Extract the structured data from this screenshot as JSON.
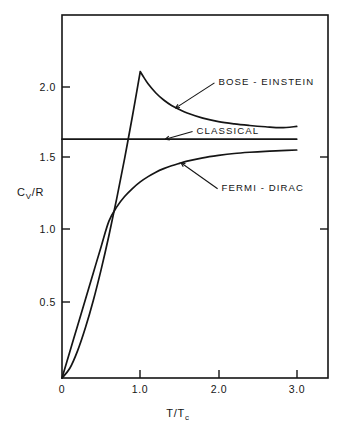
{
  "chart_data": {
    "type": "line",
    "title": "",
    "xlabel": "T/Tc",
    "ylabel": "Cv/R",
    "xlim": [
      0,
      3.4
    ],
    "ylim": [
      0,
      2.28
    ],
    "grid": false,
    "legend_position": "inline-annotations",
    "xticks": [
      {
        "value": 0,
        "label": "0"
      },
      {
        "value": 1.0,
        "label": "1.0"
      },
      {
        "value": 2.0,
        "label": "2.0"
      },
      {
        "value": 3.0,
        "label": "3.0"
      }
    ],
    "yticks": [
      {
        "value": 0.5,
        "label": "0.5"
      },
      {
        "value": 1.0,
        "label": "1.0"
      },
      {
        "value": 1.5,
        "label": "1.5"
      },
      {
        "value": 2.0,
        "label": "2.0"
      }
    ],
    "series": [
      {
        "name": "BOSE - EINSTEIN",
        "x": [
          0.0,
          0.1,
          0.2,
          0.3,
          0.4,
          0.5,
          0.6,
          0.7,
          0.8,
          0.9,
          0.95,
          1.0,
          1.05,
          1.1,
          1.2,
          1.3,
          1.4,
          1.5,
          1.6,
          1.8,
          2.0,
          2.2,
          2.4,
          2.6,
          2.8,
          3.0
        ],
        "y": [
          0.0,
          0.061,
          0.172,
          0.317,
          0.487,
          0.681,
          0.895,
          1.128,
          1.378,
          1.644,
          1.783,
          1.925,
          1.885,
          1.848,
          1.79,
          1.746,
          1.712,
          1.686,
          1.664,
          1.632,
          1.61,
          1.596,
          1.586,
          1.578,
          1.572,
          1.58
        ]
      },
      {
        "name": "CLASSICAL",
        "x": [
          0.0,
          3.0
        ],
        "y": [
          1.5,
          1.5
        ]
      },
      {
        "name": "FERMI - DIRAC",
        "x": [
          0.0,
          0.1,
          0.2,
          0.3,
          0.4,
          0.5,
          0.6,
          0.7,
          0.8,
          0.9,
          1.0,
          1.1,
          1.2,
          1.3,
          1.4,
          1.5,
          1.6,
          1.8,
          2.0,
          2.2,
          2.4,
          2.6,
          2.8,
          3.0
        ],
        "y": [
          0.0,
          0.165,
          0.33,
          0.495,
          0.66,
          0.825,
          0.985,
          1.075,
          1.14,
          1.19,
          1.232,
          1.265,
          1.293,
          1.315,
          1.333,
          1.348,
          1.362,
          1.383,
          1.398,
          1.41,
          1.418,
          1.424,
          1.428,
          1.432
        ]
      }
    ],
    "annotations": [
      {
        "text": "BOSE - EINSTEIN",
        "target_x": 1.45,
        "target_y": 1.695,
        "label_x": 2.0,
        "label_y": 1.86
      },
      {
        "text": "CLASSICAL",
        "target_x": 1.32,
        "target_y": 1.5,
        "label_x": 1.72,
        "label_y": 1.555
      },
      {
        "text": "FERMI - DIRAC",
        "target_x": 1.52,
        "target_y": 1.352,
        "label_x": 2.04,
        "label_y": 1.195
      }
    ]
  },
  "axis": {
    "y_title_main": "C",
    "y_title_sub": "V",
    "y_title_rest": "/R",
    "x_title_main": "T/T",
    "x_title_sub": "c"
  },
  "colors": {
    "ink": "#151515",
    "background": "#ffffff"
  }
}
